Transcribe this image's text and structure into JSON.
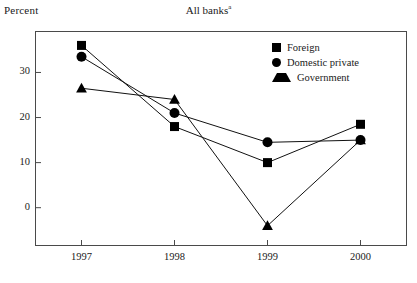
{
  "chart_title": "All banks",
  "chart_title_superscript": "a",
  "y_axis_name": "Percent",
  "legend": {
    "items": [
      {
        "label": "Foreign",
        "marker": "square-marker-icon"
      },
      {
        "label": "Domestic private",
        "marker": "circle-marker-icon"
      },
      {
        "label": "Government",
        "marker": "triangle-marker-icon"
      }
    ]
  },
  "chart_data": {
    "type": "line",
    "title": "All banks",
    "xlabel": "",
    "ylabel": "Percent",
    "x": [
      "1997",
      "1998",
      "1999",
      "2000"
    ],
    "categories": [
      "1997",
      "1998",
      "1999",
      "2000"
    ],
    "xticks": [
      "1997",
      "1998",
      "1999",
      "2000"
    ],
    "yticks": [
      0,
      10,
      20,
      30
    ],
    "ytick_labels": [
      "0",
      "10",
      "20",
      "30"
    ],
    "ylim": [
      -8.5,
      39.2
    ],
    "xlim": [
      -0.5,
      3.5
    ],
    "grid": false,
    "legend_position": "top-right inside",
    "series": [
      {
        "name": "Foreign",
        "marker": "square",
        "values": [
          36.0,
          18.0,
          10.0,
          18.5
        ]
      },
      {
        "name": "Domestic private",
        "marker": "circle",
        "values": [
          33.5,
          21.0,
          14.5,
          15.0
        ]
      },
      {
        "name": "Government",
        "marker": "triangle",
        "values": [
          26.5,
          24.0,
          -4.0,
          15.0
        ]
      }
    ]
  }
}
